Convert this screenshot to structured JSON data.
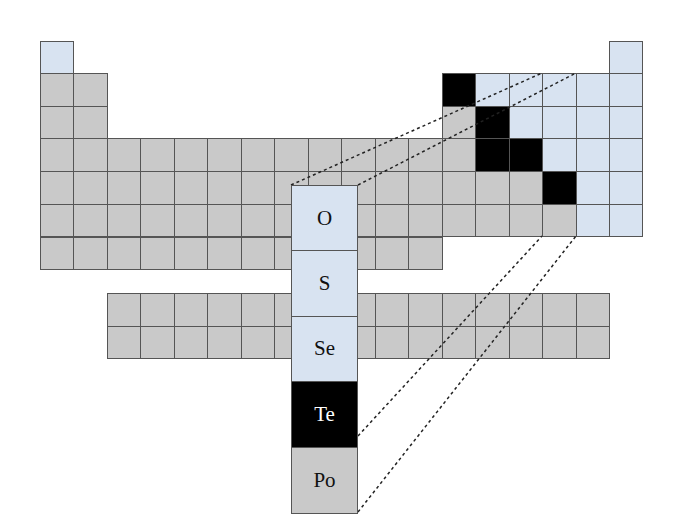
{
  "colors": {
    "metal": "#c9c9c9",
    "nonmetal": "#d8e3f1",
    "metalloid": "#000000",
    "grid_line": "#555555",
    "dash_line": "#222222"
  },
  "grid": {
    "origin_x": 40,
    "origin_y": 73,
    "cell_w": 33.47,
    "cell_h": 32.7,
    "row1_y": 41
  },
  "periodic_table": {
    "description": "Main-group periodic table shading: metals gray, nonmetals light blue, metalloids black",
    "rows": [
      {
        "period": 1,
        "cells": [
          {
            "group": 1,
            "type": "nonmetal"
          },
          {
            "group": 18,
            "type": "nonmetal"
          }
        ]
      },
      {
        "period": 2,
        "cells": [
          {
            "group": 1,
            "type": "metal"
          },
          {
            "group": 2,
            "type": "metal"
          },
          {
            "group": 13,
            "type": "metalloid"
          },
          {
            "group": 14,
            "type": "nonmetal"
          },
          {
            "group": 15,
            "type": "nonmetal"
          },
          {
            "group": 16,
            "type": "nonmetal"
          },
          {
            "group": 17,
            "type": "nonmetal"
          },
          {
            "group": 18,
            "type": "nonmetal"
          }
        ]
      },
      {
        "period": 3,
        "cells": [
          {
            "group": 1,
            "type": "metal"
          },
          {
            "group": 2,
            "type": "metal"
          },
          {
            "group": 13,
            "type": "metal"
          },
          {
            "group": 14,
            "type": "metalloid"
          },
          {
            "group": 15,
            "type": "nonmetal"
          },
          {
            "group": 16,
            "type": "nonmetal"
          },
          {
            "group": 17,
            "type": "nonmetal"
          },
          {
            "group": 18,
            "type": "nonmetal"
          }
        ]
      },
      {
        "period": 4,
        "groups_metal": [
          1,
          2,
          3,
          4,
          5,
          6,
          7,
          8,
          9,
          10,
          11,
          12,
          13
        ],
        "cells": [
          {
            "group": 14,
            "type": "metalloid"
          },
          {
            "group": 15,
            "type": "metalloid"
          },
          {
            "group": 16,
            "type": "nonmetal"
          },
          {
            "group": 17,
            "type": "nonmetal"
          },
          {
            "group": 18,
            "type": "nonmetal"
          }
        ]
      },
      {
        "period": 5,
        "groups_metal": [
          1,
          2,
          3,
          4,
          5,
          6,
          7,
          8,
          9,
          10,
          11,
          12,
          13,
          14,
          15
        ],
        "cells": [
          {
            "group": 16,
            "type": "metalloid"
          },
          {
            "group": 17,
            "type": "nonmetal"
          },
          {
            "group": 18,
            "type": "nonmetal"
          }
        ]
      },
      {
        "period": 6,
        "groups_metal": [
          1,
          2,
          3,
          4,
          5,
          6,
          7,
          8,
          9,
          10,
          11,
          12,
          13,
          14,
          15,
          16
        ],
        "cells": [
          {
            "group": 17,
            "type": "nonmetal"
          },
          {
            "group": 18,
            "type": "nonmetal"
          }
        ]
      },
      {
        "period": 7,
        "groups_metal": [
          1,
          2,
          3,
          4,
          5,
          6,
          7,
          8,
          9,
          10,
          11,
          12
        ],
        "cells": []
      }
    ],
    "f_block": {
      "x": 107,
      "y": 293,
      "cols": 15,
      "rows": 2,
      "type": "metal"
    }
  },
  "highlight_column": {
    "group": 16,
    "title": "Group 16 (Chalcogens)",
    "elements": [
      {
        "symbol": "O",
        "type": "nonmetal"
      },
      {
        "symbol": "S",
        "type": "nonmetal"
      },
      {
        "symbol": "Se",
        "type": "nonmetal"
      },
      {
        "symbol": "Te",
        "type": "metalloid"
      },
      {
        "symbol": "Po",
        "type": "metal"
      }
    ]
  },
  "legend_types": [
    "metal",
    "nonmetal",
    "metalloid"
  ]
}
